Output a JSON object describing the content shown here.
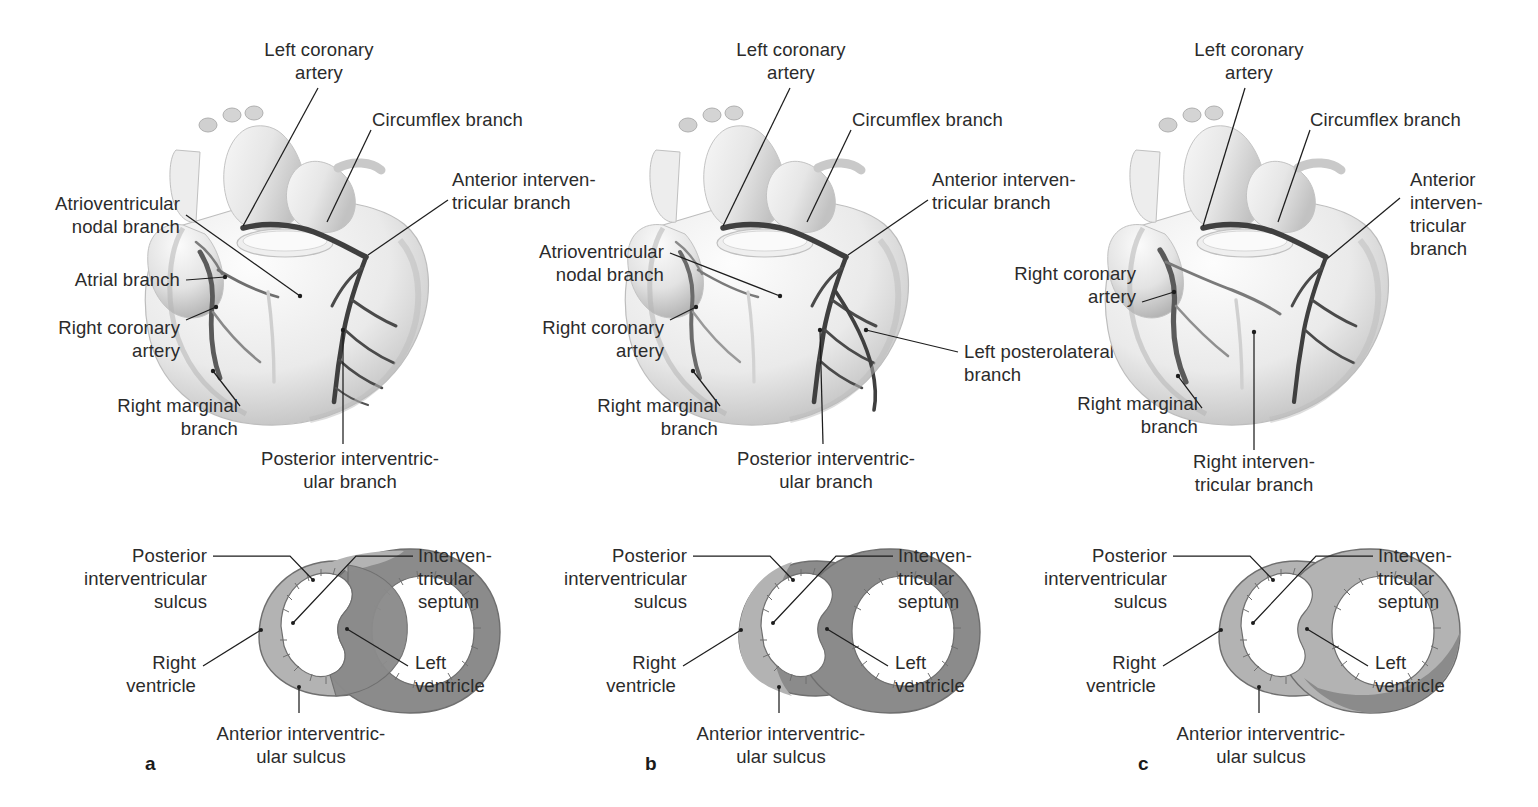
{
  "figure": {
    "type": "anatomical-illustration",
    "rows": [
      "anterior-heart-views",
      "ventricular-cross-sections"
    ]
  },
  "panels": [
    {
      "letter": "a",
      "heart_labels": [
        {
          "id": "left-coronary-artery",
          "text": "Left coronary\nartery"
        },
        {
          "id": "circumflex-branch",
          "text": "Circumflex branch"
        },
        {
          "id": "anterior-interventricular-branch",
          "text": "Anterior interven-\ntricular branch"
        },
        {
          "id": "atrioventricular-nodal-branch",
          "text": "Atrioventricular\nnodal branch"
        },
        {
          "id": "atrial-branch",
          "text": "Atrial branch"
        },
        {
          "id": "right-coronary-artery",
          "text": "Right coronary\nartery"
        },
        {
          "id": "right-marginal-branch",
          "text": "Right marginal\nbranch"
        },
        {
          "id": "posterior-interventricular-branch",
          "text": "Posterior interventric-\nular branch"
        }
      ],
      "section_labels": [
        {
          "id": "posterior-interventricular-sulcus",
          "text": "Posterior\ninterventricular\nsulcus"
        },
        {
          "id": "interventricular-septum",
          "text": "Interven-\ntricular\nseptum"
        },
        {
          "id": "right-ventricle",
          "text": "Right\nventricle"
        },
        {
          "id": "left-ventricle",
          "text": "Left\nventricle"
        },
        {
          "id": "anterior-interventricular-sulcus",
          "text": "Anterior interventric-\nular sulcus"
        }
      ],
      "section_shading": "balanced"
    },
    {
      "letter": "b",
      "heart_labels": [
        {
          "id": "left-coronary-artery",
          "text": "Left coronary\nartery"
        },
        {
          "id": "circumflex-branch",
          "text": "Circumflex branch"
        },
        {
          "id": "anterior-interventricular-branch",
          "text": "Anterior interven-\ntricular branch"
        },
        {
          "id": "atrioventricular-nodal-branch",
          "text": "Atrioventricular\nnodal branch"
        },
        {
          "id": "right-coronary-artery",
          "text": "Right coronary\nartery"
        },
        {
          "id": "right-marginal-branch",
          "text": "Right marginal\nbranch"
        },
        {
          "id": "posterior-interventricular-branch",
          "text": "Posterior interventric-\nular branch"
        },
        {
          "id": "left-posterolateral-branch",
          "text": "Left posterolateral\nbranch"
        }
      ],
      "section_labels": [
        {
          "id": "posterior-interventricular-sulcus",
          "text": "Posterior\ninterventricular\nsulcus"
        },
        {
          "id": "interventricular-septum",
          "text": "Interven-\ntricular\nseptum"
        },
        {
          "id": "right-ventricle",
          "text": "Right\nventricle"
        },
        {
          "id": "left-ventricle",
          "text": "Left\nventricle"
        },
        {
          "id": "anterior-interventricular-sulcus",
          "text": "Anterior interventric-\nular sulcus"
        }
      ],
      "section_shading": "left-dominant"
    },
    {
      "letter": "c",
      "heart_labels": [
        {
          "id": "left-coronary-artery",
          "text": "Left coronary\nartery"
        },
        {
          "id": "circumflex-branch",
          "text": "Circumflex branch"
        },
        {
          "id": "anterior-interventricular-branch",
          "text": "Anterior\ninterven-\ntricular\nbranch"
        },
        {
          "id": "right-coronary-artery",
          "text": "Right coronary\nartery"
        },
        {
          "id": "right-marginal-branch",
          "text": "Right marginal\nbranch"
        },
        {
          "id": "right-interventricular-branch",
          "text": "Right interven-\ntricular branch"
        }
      ],
      "section_labels": [
        {
          "id": "posterior-interventricular-sulcus",
          "text": "Posterior\ninterventricular\nsulcus"
        },
        {
          "id": "interventricular-septum",
          "text": "Interven-\ntricular\nseptum"
        },
        {
          "id": "right-ventricle",
          "text": "Right\nventricle"
        },
        {
          "id": "left-ventricle",
          "text": "Left\nventricle"
        },
        {
          "id": "anterior-interventricular-sulcus",
          "text": "Anterior interventric-\nular sulcus"
        }
      ],
      "section_shading": "right-dominant"
    }
  ],
  "colors": {
    "text": "#2b2b2b",
    "leader_line": "#1d1d1d",
    "background": "#ffffff",
    "myocardium_light": "#b3b3b3",
    "myocardium_dark": "#8b8b8b",
    "section_outline": "#6f6f6f",
    "heart_fill_light": "#f1f1f1",
    "heart_fill_mid": "#dcdcdc",
    "heart_shadow": "#b8b8b8",
    "artery_dark": "#4a4a4a",
    "artery_light": "#c9c9c9"
  }
}
